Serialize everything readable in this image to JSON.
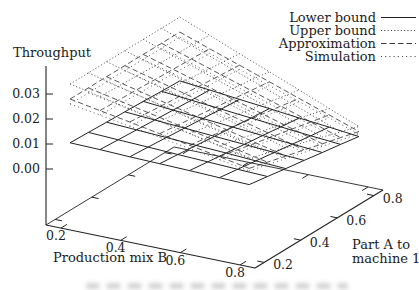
{
  "figure": {
    "zlabel": "Throughput",
    "xlabel": "Production mix B",
    "ylabel_line1": "Part A to",
    "ylabel_line2": "machine 1"
  },
  "legend": {
    "items": [
      {
        "label": "Lower bound",
        "style": "solid"
      },
      {
        "label": "Upper bound",
        "style": "dotted"
      },
      {
        "label": "Approximation",
        "style": "dashed"
      },
      {
        "label": "Simulation",
        "style": "fine-dotted"
      }
    ]
  },
  "colors": {
    "line": "#222222",
    "dotted_line": "#3c3c3c"
  },
  "chart_data": {
    "type": "3d-wireframe-surface",
    "title": "",
    "xlabel": "Production mix B",
    "ylabel": "Part A to machine 1",
    "zlabel": "Throughput",
    "xlim": [
      0.15,
      0.85
    ],
    "ylim": [
      0.15,
      0.85
    ],
    "zlim": [
      0.0,
      0.03
    ],
    "x_ticks": [
      0.2,
      0.4,
      0.6,
      0.8
    ],
    "y_ticks": [
      0.2,
      0.4,
      0.6,
      0.8
    ],
    "z_ticks": [
      0.0,
      0.01,
      0.02,
      0.03
    ],
    "x_tick_labels": [
      "0.2",
      "0.4",
      "0.6",
      "0.8"
    ],
    "y_tick_labels": [
      "0.2",
      "0.4",
      "0.6",
      "0.8"
    ],
    "z_tick_labels": [
      "0.00",
      "0.01",
      "0.02",
      "0.03"
    ],
    "grid_x_production_mix_B": [
      0.2,
      0.3,
      0.4,
      0.5,
      0.6,
      0.7,
      0.8
    ],
    "grid_y_part_A_to_machine_1": [
      0.2,
      0.3,
      0.4,
      0.5,
      0.6,
      0.7,
      0.8
    ],
    "legend_position": "top-right",
    "grid": "wireframe 6x6 cells, no hidden-line removal",
    "surfaces": [
      {
        "name": "Upper bound",
        "style": "dotted",
        "z": [
          [
            0.033,
            0.033,
            0.033,
            0.033,
            0.033,
            0.033,
            0.033
          ],
          [
            0.0305,
            0.0301,
            0.0297,
            0.0293,
            0.0289,
            0.0286,
            0.0282
          ],
          [
            0.028,
            0.0272,
            0.0264,
            0.0257,
            0.0249,
            0.0241,
            0.0233
          ],
          [
            0.0255,
            0.0243,
            0.0232,
            0.022,
            0.0208,
            0.0197,
            0.0185
          ],
          [
            0.023,
            0.0214,
            0.0199,
            0.0183,
            0.0168,
            0.0152,
            0.0137
          ],
          [
            0.0205,
            0.0186,
            0.0166,
            0.0147,
            0.0127,
            0.0108,
            0.0088
          ],
          [
            0.018,
            0.0157,
            0.0133,
            0.011,
            0.0087,
            0.0063,
            0.004
          ]
        ]
      },
      {
        "name": "Simulation",
        "style": "fine-dotted",
        "z": [
          [
            0.025,
            0.025,
            0.025,
            0.025,
            0.025,
            0.025,
            0.025
          ],
          [
            0.023,
            0.0227,
            0.0223,
            0.022,
            0.0217,
            0.0213,
            0.021
          ],
          [
            0.021,
            0.0203,
            0.0197,
            0.019,
            0.0183,
            0.0177,
            0.017
          ],
          [
            0.019,
            0.018,
            0.017,
            0.016,
            0.015,
            0.014,
            0.013
          ],
          [
            0.017,
            0.0157,
            0.0143,
            0.013,
            0.0117,
            0.0103,
            0.009
          ],
          [
            0.015,
            0.0133,
            0.0117,
            0.01,
            0.0083,
            0.0067,
            0.005
          ],
          [
            0.013,
            0.011,
            0.009,
            0.007,
            0.005,
            0.003,
            0.001
          ]
        ]
      },
      {
        "name": "Approximation",
        "style": "dashed",
        "z": [
          [
            0.027,
            0.027,
            0.027,
            0.027,
            0.027,
            0.027,
            0.027
          ],
          [
            0.0248,
            0.0245,
            0.0242,
            0.0238,
            0.0235,
            0.0232,
            0.0228
          ],
          [
            0.0227,
            0.022,
            0.0213,
            0.0207,
            0.02,
            0.0193,
            0.0187
          ],
          [
            0.0205,
            0.0195,
            0.0185,
            0.0175,
            0.0165,
            0.0155,
            0.0145
          ],
          [
            0.0183,
            0.017,
            0.0157,
            0.0143,
            0.013,
            0.0117,
            0.0103
          ],
          [
            0.0162,
            0.0145,
            0.0128,
            0.0112,
            0.0095,
            0.0078,
            0.0062
          ],
          [
            0.014,
            0.012,
            0.01,
            0.008,
            0.006,
            0.004,
            0.002
          ]
        ]
      },
      {
        "name": "Lower bound",
        "style": "solid",
        "z": [
          [
            0.0095,
            0.0092,
            0.0088,
            0.0085,
            0.0082,
            0.0078,
            0.0075
          ],
          [
            0.0092,
            0.0087,
            0.0082,
            0.0077,
            0.0072,
            0.0067,
            0.0063
          ],
          [
            0.0088,
            0.0082,
            0.0076,
            0.0069,
            0.0063,
            0.0056,
            0.005
          ],
          [
            0.0085,
            0.0077,
            0.0069,
            0.0061,
            0.0053,
            0.0045,
            0.0038
          ],
          [
            0.0082,
            0.0072,
            0.0063,
            0.0053,
            0.0044,
            0.0034,
            0.0025
          ],
          [
            0.0078,
            0.0067,
            0.0056,
            0.0045,
            0.0034,
            0.0023,
            0.0013
          ],
          [
            0.0075,
            0.0063,
            0.005,
            0.0038,
            0.0025,
            0.0013,
            0.0
          ]
        ]
      }
    ]
  }
}
